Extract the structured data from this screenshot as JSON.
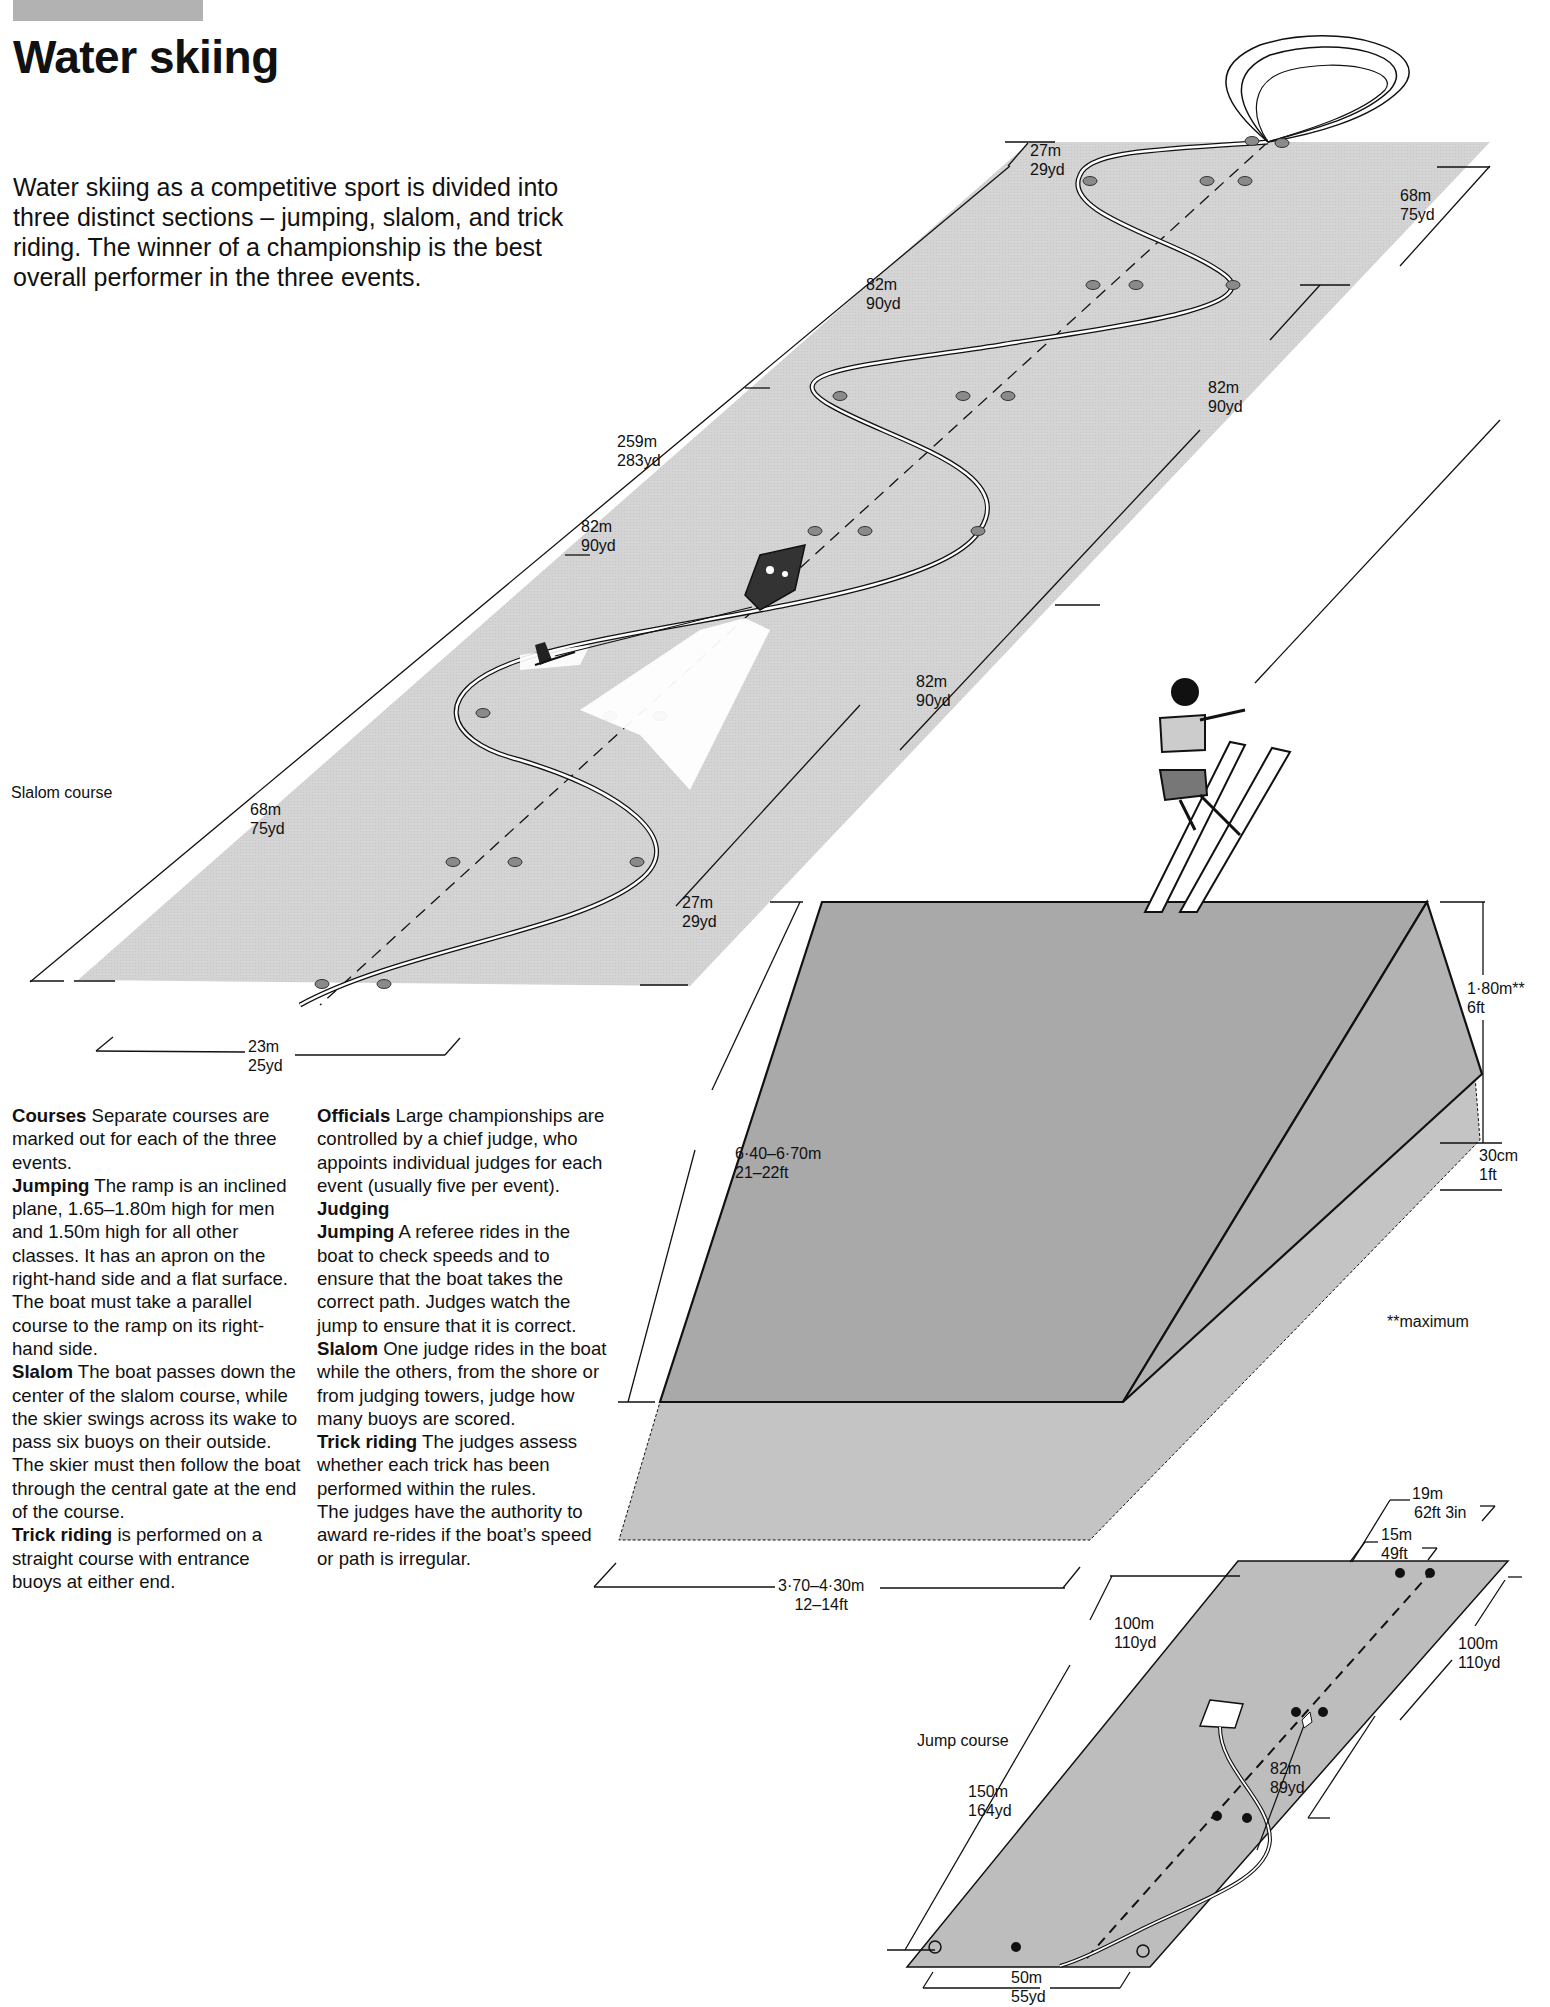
{
  "header": {
    "title": "Water skiing",
    "intro": "Water skiing as a competitive sport is divided into three distinct sections – jumping, slalom, and trick riding. The winner of a championship is the best overall performer in the three events."
  },
  "colors": {
    "water": "#d4d4d4",
    "ramp_top": "#a9a9a9",
    "ramp_apron": "#c4c4c4",
    "jump_course": "#bdbdbd",
    "ink": "#111111",
    "header_bar": "#b2b2b2"
  },
  "text_columns": {
    "left": [
      {
        "heading": "Courses",
        "body": " Separate courses are marked out for each of the three events."
      },
      {
        "heading": "Jumping",
        "body": " The ramp is an inclined plane, 1.65–1.80m high for men and 1.50m high for all other classes. It has an apron on the right-hand side and a flat surface."
      },
      {
        "heading": "",
        "body": "The boat must take a parallel course to the ramp on its right-hand side."
      },
      {
        "heading": "Slalom",
        "body": " The boat passes down the center of the slalom course, while the skier swings across its wake to pass six buoys on their outside. The skier must then follow the boat through the central gate at the end of the course."
      },
      {
        "heading": "Trick riding",
        "body": " is performed on a straight course with entrance buoys at either end."
      }
    ],
    "right": [
      {
        "heading": "Officials",
        "body": " Large championships are controlled by a chief judge, who appoints individual judges for each event (usually five per event)."
      },
      {
        "heading": "Judging",
        "body": ""
      },
      {
        "heading": "Jumping",
        "body": " A referee rides in the boat to check speeds and to ensure that the boat takes the correct path. Judges watch the jump to ensure that it is correct."
      },
      {
        "heading": "Slalom",
        "body": " One judge rides in the boat while the others, from the shore or from judging towers, judge how many buoys are scored."
      },
      {
        "heading": "Trick riding",
        "body": " The judges assess whether each trick has been performed within the rules."
      },
      {
        "heading": "",
        "body": "The judges have the authority to award re-rides if the boat’s speed or path is irregular."
      }
    ]
  },
  "slalom": {
    "caption": "Slalom course",
    "dims": {
      "top_end_m": "27m",
      "top_end_yd": "29yd",
      "top_right_m": "68m",
      "top_right_yd": "75yd",
      "seg1_m": "82m",
      "seg1_yd": "90yd",
      "seg2_right_m": "82m",
      "seg2_right_yd": "90yd",
      "total_m": "259m",
      "total_yd": "283yd",
      "seg3_left_m": "82m",
      "seg3_left_yd": "90yd",
      "seg4_right_m": "82m",
      "seg4_right_yd": "90yd",
      "bottom_left_m": "68m",
      "bottom_left_yd": "75yd",
      "bottom_end_m": "27m",
      "bottom_end_yd": "29yd",
      "width_m": "23m",
      "width_yd": "25yd"
    }
  },
  "ramp": {
    "length_m": "6·40–6·70m",
    "length_ft": "21–22ft",
    "height_m": "1·80m**",
    "height_ft": "6ft",
    "apron_cm": "30cm",
    "apron_ft": "1ft",
    "width_m": "3·70–4·30m",
    "width_ft": "12–14ft",
    "footnote": "**maximum"
  },
  "jump": {
    "caption": "Jump course",
    "dims": {
      "outer_m": "19m",
      "outer_ft": "62ft 3in",
      "inner_m": "15m",
      "inner_ft": "49ft",
      "left_top_m": "100m",
      "left_top_yd": "110yd",
      "right_top_m": "100m",
      "right_top_yd": "110yd",
      "left_m": "150m",
      "left_yd": "164yd",
      "right_m": "82m",
      "right_yd": "89yd",
      "base_m": "50m",
      "base_yd": "55yd"
    }
  }
}
